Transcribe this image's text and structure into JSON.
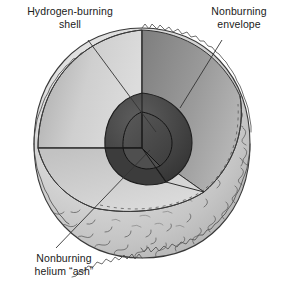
{
  "figure": {
    "type": "cutaway-diagram",
    "background_color": "#ffffff"
  },
  "labels": {
    "hydrogen_shell": "Hydrogen-burning\nshell",
    "nonburning_envelope": "Nonburning\nenvelope",
    "helium_ash": "Nonburning\nhelium “ash”"
  },
  "layers": [
    {
      "name": "nonburning-envelope",
      "color": "#d5d5d5",
      "note": "outer convective envelope with granulated surface texture"
    },
    {
      "name": "envelope-cut-face-left",
      "color": "#c9c9c9"
    },
    {
      "name": "envelope-cut-face-right",
      "color": "#8f8f8f"
    },
    {
      "name": "hydrogen-burning-shell",
      "color": "#6e6e6e"
    },
    {
      "name": "helium-ash-core",
      "color": "#3a3a3a"
    },
    {
      "name": "inner-core-face",
      "color": "#4c4c4c"
    }
  ],
  "colors": {
    "outline": "#2b2b2b",
    "leader_line": "#333333",
    "text": "#1a1a1a",
    "surface_texture": "#5a5a5a"
  },
  "leaders": [
    {
      "name": "leader-hydrogen-shell",
      "from": [
        88,
        40
      ],
      "to": [
        152,
        128
      ]
    },
    {
      "name": "leader-nonburning-envelope",
      "from": [
        222,
        40
      ],
      "to": [
        178,
        108
      ]
    },
    {
      "name": "leader-helium-ash",
      "from": [
        58,
        248
      ],
      "to": [
        150,
        148
      ]
    }
  ]
}
